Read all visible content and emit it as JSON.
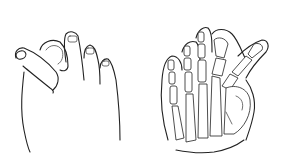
{
  "figure": {
    "panels": [
      {
        "id": "A",
        "label": "A",
        "description": "foot-external-view"
      },
      {
        "id": "B",
        "label": "B",
        "description": "foot-skeletal-view"
      }
    ]
  }
}
